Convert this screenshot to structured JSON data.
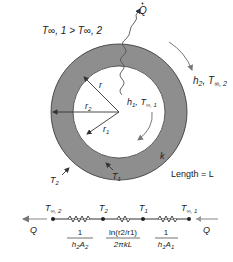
{
  "diagram": {
    "title_condition": "T∞, 1 > T∞, 2",
    "heat_flow_label": "Q",
    "outer_convection": {
      "h": "h",
      "h_sub": "2",
      "T": "T",
      "T_sub": "∞, 2"
    },
    "inner_convection": {
      "h": "h",
      "h_sub": "1",
      "T": "T",
      "T_sub": "∞, 1"
    },
    "radius_labels": {
      "r": "r",
      "r2": "r",
      "r2_sub": "2",
      "r1": "r",
      "r1_sub": "1"
    },
    "surface_temps": {
      "T2": "T",
      "T2_sub": "2",
      "T1": "T",
      "T1_sub": "1"
    },
    "conductivity": "k",
    "length_label": "Length = L",
    "colors": {
      "wall": "#8e8e8e",
      "outline": "#333333",
      "arrow": "#777777",
      "text": "#222222"
    }
  },
  "circuit": {
    "nodes": [
      {
        "T": "T",
        "sub": "∞, 2"
      },
      {
        "T": "T",
        "sub": "2"
      },
      {
        "T": "T",
        "sub": "1"
      },
      {
        "T": "T",
        "sub": "∞, 1"
      }
    ],
    "resistances": [
      {
        "num": "1",
        "den": "h",
        "den_sub": "2",
        "den2": "A",
        "den2_sub": "2"
      },
      {
        "num": "ln(r2/r1)",
        "den": "2πkL"
      },
      {
        "num": "1",
        "den": "h",
        "den_sub": "1",
        "den2": "A",
        "den2_sub": "1"
      }
    ],
    "heat_left": "Q",
    "heat_right": "Q"
  }
}
